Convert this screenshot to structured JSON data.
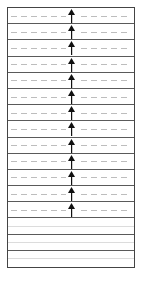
{
  "diagram": {
    "colors": {
      "border": "#444444",
      "divider": "#5a5a5a",
      "dashed_line": "#bdbdbd",
      "faint_line": "#dcdcdc",
      "arrow": "#111111",
      "background": "#ffffff"
    },
    "rows": [
      {
        "type": "arrow",
        "direction": "up"
      },
      {
        "type": "arrow",
        "direction": "up"
      },
      {
        "type": "arrow",
        "direction": "up"
      },
      {
        "type": "arrow",
        "direction": "up"
      },
      {
        "type": "arrow",
        "direction": "up"
      },
      {
        "type": "arrow",
        "direction": "up"
      },
      {
        "type": "arrow",
        "direction": "up"
      },
      {
        "type": "arrow",
        "direction": "up"
      },
      {
        "type": "arrow",
        "direction": "up"
      },
      {
        "type": "arrow",
        "direction": "up"
      },
      {
        "type": "arrow",
        "direction": "up"
      },
      {
        "type": "arrow",
        "direction": "up"
      },
      {
        "type": "arrow",
        "direction": "up"
      },
      {
        "type": "empty"
      },
      {
        "type": "empty"
      },
      {
        "type": "empty"
      }
    ],
    "arrow_row_count": 13,
    "empty_row_count": 3
  }
}
